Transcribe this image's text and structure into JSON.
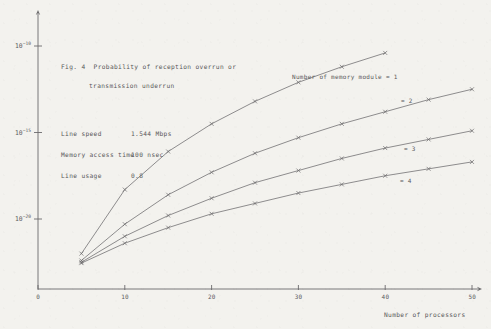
{
  "figure": {
    "caption_line1": "Fig. 4  Probability of reception overrun or",
    "caption_line2": "transmission underrun"
  },
  "parameters": [
    {
      "name": "Line speed",
      "value": "1.544 Mbps"
    },
    {
      "name": "Memory access time",
      "value": "100 nsec"
    },
    {
      "name": "Line usage",
      "value": "0.8"
    }
  ],
  "chart_data": {
    "type": "line",
    "title": "Fig. 4  Probability of reception overrun or transmission underrun",
    "xlabel": "Number of processors",
    "ylabel": "",
    "xlim": [
      0,
      50
    ],
    "ylim": [
      -22.6,
      -8.6
    ],
    "yscale": "log",
    "xticks": [
      0,
      10,
      20,
      30,
      40,
      50
    ],
    "xticklabels": [
      "0",
      "10",
      "20",
      "30",
      "40",
      "50"
    ],
    "yticks": [
      -10,
      -15,
      -20
    ],
    "yticklabels": [
      "10-10",
      "10-15",
      "10-20"
    ],
    "grid": false,
    "legend": "inline-annotations",
    "marker": "x",
    "series": [
      {
        "name": "Number of memory module = 1",
        "memory_modules": 1,
        "annotation": "Number of memory module = 1",
        "x": [
          5,
          10,
          15,
          20,
          25,
          30,
          35,
          40
        ],
        "log10_y": [
          -22.0,
          -18.3,
          -16.1,
          -14.5,
          -13.2,
          -12.1,
          -11.2,
          -10.4
        ]
      },
      {
        "name": "Number of memory module = 2",
        "memory_modules": 2,
        "annotation": "= 2",
        "x": [
          5,
          10,
          15,
          20,
          25,
          30,
          35,
          40,
          45,
          50
        ],
        "log10_y": [
          -22.4,
          -20.3,
          -18.6,
          -17.3,
          -16.2,
          -15.3,
          -14.5,
          -13.8,
          -13.1,
          -12.5
        ]
      },
      {
        "name": "Number of memory module = 3",
        "memory_modules": 3,
        "annotation": "= 3",
        "x": [
          5,
          10,
          15,
          20,
          25,
          30,
          35,
          40,
          45,
          50
        ],
        "log10_y": [
          -22.5,
          -21.0,
          -19.8,
          -18.8,
          -17.9,
          -17.2,
          -16.5,
          -15.9,
          -15.4,
          -14.9
        ]
      },
      {
        "name": "Number of memory module = 4",
        "memory_modules": 4,
        "annotation": "= 4",
        "x": [
          5,
          10,
          15,
          20,
          25,
          30,
          35,
          40,
          45,
          50
        ],
        "log10_y": [
          -22.55,
          -21.4,
          -20.5,
          -19.7,
          -19.1,
          -18.5,
          -18.0,
          -17.5,
          -17.1,
          -16.7
        ]
      }
    ]
  },
  "axis": {
    "x_title": "Number of processors",
    "y_labels": [
      {
        "base": "10",
        "exp": "-10"
      },
      {
        "base": "10",
        "exp": "-15"
      },
      {
        "base": "10",
        "exp": "-20"
      }
    ]
  },
  "style": {
    "ink": "#5d5c5e",
    "paper": "#f3f2ee",
    "line": "#6b6a6c"
  }
}
